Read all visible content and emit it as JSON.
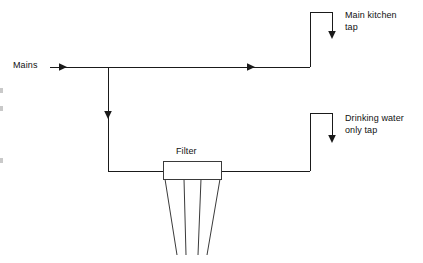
{
  "diagram": {
    "type": "schematic",
    "canvas": {
      "width": 423,
      "height": 263,
      "background": "#ffffff"
    },
    "line_color": "#1a1a1a",
    "labels": {
      "mains": "Mains",
      "main_kitchen_tap_line1": "Main kitchen",
      "main_kitchen_tap_line2": "tap",
      "drinking_water_line1": "Drinking water",
      "drinking_water_line2": "only tap",
      "filter": "Filter"
    },
    "nodes": [
      {
        "name": "mains-inlet",
        "x": 50,
        "y": 67
      },
      {
        "name": "tee-junction",
        "x": 108,
        "y": 67
      },
      {
        "name": "kitchen-riser-base",
        "x": 310,
        "y": 67
      },
      {
        "name": "kitchen-tap-outlet",
        "x": 332,
        "y": 38
      },
      {
        "name": "branch-down",
        "x": 108,
        "y": 171
      },
      {
        "name": "filter-inlet",
        "x": 163,
        "y": 171
      },
      {
        "name": "filter-outlet",
        "x": 222,
        "y": 171
      },
      {
        "name": "drinking-riser-base",
        "x": 310,
        "y": 171
      },
      {
        "name": "drinking-tap-outlet",
        "x": 332,
        "y": 142
      }
    ],
    "paths": {
      "mains_feed": "M 50 67 L 310 67",
      "kitchen_riser": "M 310 67 L 310 12 L 332 12 L 332 38",
      "branch_drop": "M 108 67 L 108 171",
      "filter_feed": "M 108 171 L 163 171",
      "filter_discharge": "M 222 171 L 310 171",
      "drinking_riser": "M 310 171 L 310 113 L 332 113 L 332 142"
    },
    "arrows": [
      {
        "name": "mains-inlet-arrow",
        "tip_x": 67,
        "tip_y": 67,
        "direction": "right"
      },
      {
        "name": "mains-flow-arrow",
        "tip_x": 255,
        "tip_y": 67,
        "direction": "right"
      },
      {
        "name": "branch-flow-arrow",
        "tip_x": 108,
        "tip_y": 119,
        "direction": "down"
      },
      {
        "name": "kitchen-tap-arrow",
        "tip_x": 332,
        "tip_y": 39,
        "direction": "down"
      },
      {
        "name": "drinking-tap-arrow",
        "tip_x": 332,
        "tip_y": 143,
        "direction": "down"
      }
    ],
    "filter_unit": {
      "head_box": {
        "x": 163,
        "y": 161,
        "width": 59,
        "height": 18
      },
      "cartridge": {
        "top_left_x": 165,
        "top_right_x": 220,
        "bottom_left_x": 177,
        "bottom_right_x": 207,
        "top_y": 179,
        "bottom_y": 255,
        "inner_lines": [
          {
            "top_x": 184,
            "bottom_x": 186
          },
          {
            "top_x": 201,
            "bottom_x": 198
          }
        ]
      }
    },
    "edge_marks": [
      {
        "x": 0,
        "y": 88,
        "width": 3,
        "height": 5
      },
      {
        "x": 0,
        "y": 106,
        "width": 3,
        "height": 5
      },
      {
        "x": 0,
        "y": 158,
        "width": 3,
        "height": 5
      }
    ]
  }
}
